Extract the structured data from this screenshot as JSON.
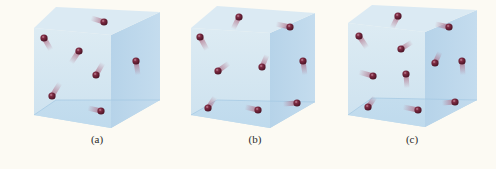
{
  "figure": {
    "colors": {
      "background": "#fcfaf3",
      "cube_front": "#c9e0ef",
      "cube_top": "#dbeaf3",
      "cube_side": "#b8d5ea",
      "cube_bottom": "#a9cde6",
      "molecule": "#6a1f35",
      "molecule_highlight": "#c37a8c",
      "trail": "#b06a82"
    },
    "panels": [
      {
        "label": "(a)",
        "label_x": 97,
        "molecule_count": 7,
        "cube": {
          "ftl": [
            34,
            28
          ],
          "btl": [
            56,
            7
          ],
          "btr": [
            160,
            12
          ],
          "ftr": [
            111,
            35
          ],
          "fbl": [
            34,
            115
          ],
          "fbr": [
            111,
            128
          ],
          "bbr": [
            160,
            100
          ],
          "bbl": [
            56,
            100
          ]
        },
        "molecules": [
          {
            "x": 104,
            "y": 22,
            "tx": 91,
            "ty": 18
          },
          {
            "x": 44,
            "y": 38,
            "tx": 51,
            "ty": 50
          },
          {
            "x": 79,
            "y": 51,
            "tx": 71,
            "ty": 63
          },
          {
            "x": 136,
            "y": 61,
            "tx": 138,
            "ty": 75
          },
          {
            "x": 96,
            "y": 75,
            "tx": 103,
            "ty": 63
          },
          {
            "x": 52,
            "y": 96,
            "tx": 60,
            "ty": 83
          },
          {
            "x": 101,
            "y": 111,
            "tx": 88,
            "ty": 108
          }
        ]
      },
      {
        "label": "(b)",
        "label_x": 255,
        "molecule_count": 9,
        "cube": {
          "ftl": [
            191,
            28
          ],
          "btl": [
            217,
            6
          ],
          "btr": [
            315,
            13
          ],
          "ftr": [
            270,
            33
          ],
          "fbl": [
            191,
            115
          ],
          "fbr": [
            270,
            128
          ],
          "bbr": [
            315,
            102
          ],
          "bbl": [
            217,
            100
          ]
        },
        "molecules": [
          {
            "x": 239,
            "y": 17,
            "tx": 233,
            "ty": 29
          },
          {
            "x": 290,
            "y": 27,
            "tx": 276,
            "ty": 24
          },
          {
            "x": 200,
            "y": 37,
            "tx": 207,
            "ty": 50
          },
          {
            "x": 218,
            "y": 71,
            "tx": 229,
            "ty": 63
          },
          {
            "x": 262,
            "y": 67,
            "tx": 267,
            "ty": 55
          },
          {
            "x": 303,
            "y": 61,
            "tx": 305,
            "ty": 75
          },
          {
            "x": 208,
            "y": 108,
            "tx": 215,
            "ty": 97
          },
          {
            "x": 258,
            "y": 110,
            "tx": 245,
            "ty": 107
          },
          {
            "x": 297,
            "y": 103,
            "tx": 283,
            "ty": 104
          }
        ]
      },
      {
        "label": "(c)",
        "label_x": 412,
        "molecule_count": 11,
        "cube": {
          "ftl": [
            348,
            23
          ],
          "btl": [
            372,
            5
          ],
          "btr": [
            477,
            10
          ],
          "ftr": [
            425,
            32
          ],
          "fbl": [
            348,
            115
          ],
          "fbr": [
            425,
            127
          ],
          "bbr": [
            477,
            100
          ],
          "bbl": [
            372,
            98
          ]
        },
        "molecules": [
          {
            "x": 398,
            "y": 16,
            "tx": 392,
            "ty": 28
          },
          {
            "x": 449,
            "y": 27,
            "tx": 435,
            "ty": 24
          },
          {
            "x": 359,
            "y": 36,
            "tx": 367,
            "ty": 48
          },
          {
            "x": 401,
            "y": 49,
            "tx": 412,
            "ty": 42
          },
          {
            "x": 435,
            "y": 63,
            "tx": 440,
            "ty": 52
          },
          {
            "x": 462,
            "y": 61,
            "tx": 463,
            "ty": 75
          },
          {
            "x": 373,
            "y": 76,
            "tx": 359,
            "ty": 72
          },
          {
            "x": 406,
            "y": 74,
            "tx": 407,
            "ty": 88
          },
          {
            "x": 368,
            "y": 107,
            "tx": 375,
            "ty": 97
          },
          {
            "x": 418,
            "y": 110,
            "tx": 403,
            "ty": 107
          },
          {
            "x": 455,
            "y": 102,
            "tx": 442,
            "ty": 103
          }
        ]
      }
    ]
  }
}
